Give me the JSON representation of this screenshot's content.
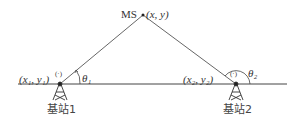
{
  "diagram": {
    "mobile_station": {
      "label": "MS",
      "coords": "(x, y)"
    },
    "base_station_1": {
      "label": "基站1",
      "coords": "(x₁, y₁)",
      "angle": "θ₁",
      "marker": "(·)"
    },
    "base_station_2": {
      "label": "基站2",
      "coords": "(x₂, y₂)",
      "angle": "θ₂",
      "marker": "(·)"
    }
  }
}
